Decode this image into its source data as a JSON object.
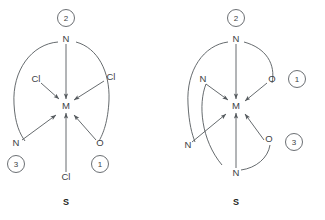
{
  "figure": {
    "background_color": "#ffffff",
    "line_color": "#555a5e",
    "text_color": "#3d4145",
    "width": 325,
    "height": 220
  },
  "diagrams": [
    {
      "id": "left-diagram",
      "caption": "S",
      "center_atom": "M",
      "ligands": [
        {
          "label": "N",
          "position": "top"
        },
        {
          "label": "Cl",
          "position": "upper-left"
        },
        {
          "label": "Cl",
          "position": "upper-right"
        },
        {
          "label": "N",
          "position": "lower-left"
        },
        {
          "label": "O",
          "position": "lower-right"
        },
        {
          "label": "Cl",
          "position": "bottom"
        }
      ],
      "priority_numbers": [
        {
          "value": "2",
          "attached_to": "N",
          "position": "top"
        },
        {
          "value": "3",
          "attached_to": "N",
          "position": "lower-left"
        },
        {
          "value": "1",
          "attached_to": "O",
          "position": "lower-right"
        }
      ]
    },
    {
      "id": "right-diagram",
      "caption": "S",
      "center_atom": "M",
      "ligands": [
        {
          "label": "N",
          "position": "top"
        },
        {
          "label": "N",
          "position": "upper-left"
        },
        {
          "label": "O",
          "position": "upper-right"
        },
        {
          "label": "N",
          "position": "lower-left"
        },
        {
          "label": "O",
          "position": "lower-right"
        },
        {
          "label": "N",
          "position": "bottom"
        }
      ],
      "priority_numbers": [
        {
          "value": "2",
          "attached_to": "N",
          "position": "top"
        },
        {
          "value": "1",
          "attached_to": "O",
          "position": "upper-right"
        },
        {
          "value": "3",
          "attached_to": "O",
          "position": "lower-right"
        }
      ]
    }
  ]
}
